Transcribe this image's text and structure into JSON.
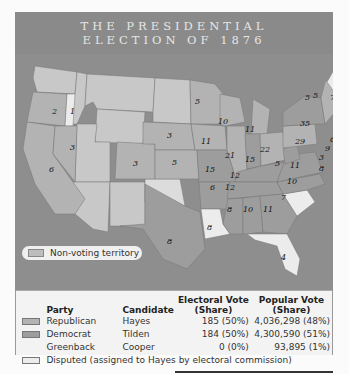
{
  "title": {
    "line1": "THE PRESIDENTIAL",
    "line2": "ELECTION OF 1876"
  },
  "colors": {
    "water": "#8e8e8e",
    "republican": "#b3b3b3",
    "democrat": "#9d9d9d",
    "disputed": "#ececec",
    "non_voting": "#c8c8c8"
  },
  "map": {
    "states": [
      {
        "name": "Washington",
        "votes": "",
        "party": "non_voting"
      },
      {
        "name": "Oregon",
        "votes": "2",
        "party": "republican"
      },
      {
        "name": "Oregon (disputed elector)",
        "votes": "1",
        "party": "disputed"
      },
      {
        "name": "California",
        "votes": "6",
        "party": "republican"
      },
      {
        "name": "Nevada",
        "votes": "3",
        "party": "republican"
      },
      {
        "name": "Colorado",
        "votes": "3",
        "party": "republican"
      },
      {
        "name": "Nebraska",
        "votes": "3",
        "party": "republican"
      },
      {
        "name": "Kansas",
        "votes": "5",
        "party": "republican"
      },
      {
        "name": "Texas",
        "votes": "8",
        "party": "democrat"
      },
      {
        "name": "Minnesota",
        "votes": "5",
        "party": "republican"
      },
      {
        "name": "Iowa",
        "votes": "11",
        "party": "republican"
      },
      {
        "name": "Missouri",
        "votes": "15",
        "party": "democrat"
      },
      {
        "name": "Arkansas",
        "votes": "6",
        "party": "democrat"
      },
      {
        "name": "Louisiana",
        "votes": "8",
        "party": "disputed"
      },
      {
        "name": "Wisconsin",
        "votes": "10",
        "party": "republican"
      },
      {
        "name": "Illinois",
        "votes": "21",
        "party": "republican"
      },
      {
        "name": "Michigan",
        "votes": "11",
        "party": "republican"
      },
      {
        "name": "Indiana",
        "votes": "15",
        "party": "democrat"
      },
      {
        "name": "Ohio",
        "votes": "22",
        "party": "republican"
      },
      {
        "name": "Kentucky",
        "votes": "12",
        "party": "democrat"
      },
      {
        "name": "Tennessee",
        "votes": "12",
        "party": "democrat"
      },
      {
        "name": "Mississippi",
        "votes": "8",
        "party": "democrat"
      },
      {
        "name": "Alabama",
        "votes": "10",
        "party": "democrat"
      },
      {
        "name": "Georgia",
        "votes": "11",
        "party": "democrat"
      },
      {
        "name": "Florida",
        "votes": "4",
        "party": "disputed"
      },
      {
        "name": "South Carolina",
        "votes": "7",
        "party": "disputed"
      },
      {
        "name": "North Carolina",
        "votes": "10",
        "party": "democrat"
      },
      {
        "name": "Virginia",
        "votes": "11",
        "party": "democrat"
      },
      {
        "name": "West Virginia",
        "votes": "5",
        "party": "democrat"
      },
      {
        "name": "Pennsylvania",
        "votes": "29",
        "party": "republican"
      },
      {
        "name": "New York",
        "votes": "35",
        "party": "democrat"
      },
      {
        "name": "Vermont",
        "votes": "5",
        "party": "republican"
      },
      {
        "name": "New Hampshire",
        "votes": "5",
        "party": "republican"
      },
      {
        "name": "Maine",
        "votes": "7",
        "party": "republican"
      },
      {
        "name": "Massachusetts",
        "votes": "13",
        "party": "republican"
      },
      {
        "name": "Rhode Island",
        "votes": "4",
        "party": "republican"
      },
      {
        "name": "Connecticut",
        "votes": "6",
        "party": "democrat"
      },
      {
        "name": "New Jersey",
        "votes": "9",
        "party": "democrat"
      },
      {
        "name": "Delaware",
        "votes": "3",
        "party": "democrat"
      },
      {
        "name": "Maryland",
        "votes": "8",
        "party": "democrat"
      }
    ],
    "non_voting_label": "Non-voting territory"
  },
  "legend": {
    "headers": {
      "party": "Party",
      "candidate": "Candidate",
      "electoral": "Electoral Vote (Share)",
      "electoral_l1": "Electoral Vote",
      "electoral_l2": "(Share)",
      "popular_l1": "Popular Vote",
      "popular_l2": "(Share)"
    },
    "rows": [
      {
        "party": "Republican",
        "candidate": "Hayes",
        "electoral": "185 (50%)",
        "popular": "4,036,298 (48%)",
        "swatch": "republican"
      },
      {
        "party": "Democrat",
        "candidate": "Tilden",
        "electoral": "184 (50%)",
        "popular": "4,300,590 (51%)",
        "swatch": "democrat"
      },
      {
        "party": "Greenback",
        "candidate": "Cooper",
        "electoral": "0 (0%)",
        "popular": "93,895 (1%)",
        "swatch": ""
      }
    ],
    "disputed_label": "Disputed (assigned to Hayes by electoral commission)"
  }
}
